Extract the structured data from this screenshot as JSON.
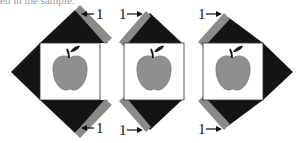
{
  "caption": "ed in the sample.",
  "colors": {
    "background": "#ffffff",
    "triangle": "#141414",
    "strip": "#8a8a8a",
    "square": "#ffffff",
    "square_border": "#333333",
    "apple": "#8f8f8f",
    "leaf": "#1a1a1a"
  },
  "blocks": [
    {
      "id": "left",
      "labels": [
        {
          "text": "1",
          "arrow": "left",
          "position": "top-right"
        },
        {
          "text": "1",
          "arrow": "left",
          "position": "bottom-right"
        }
      ]
    },
    {
      "id": "middle",
      "labels": [
        {
          "text": "1",
          "arrow": "right",
          "position": "top-left"
        },
        {
          "text": "1",
          "arrow": "right",
          "position": "bottom-left"
        }
      ]
    },
    {
      "id": "right",
      "labels": [
        {
          "text": "1",
          "arrow": "right",
          "position": "top-left"
        },
        {
          "text": "1",
          "arrow": "right",
          "position": "bottom-left"
        }
      ]
    }
  ],
  "labels": {
    "l1_top": "1",
    "l1_bottom": "1",
    "l2_top": "1",
    "l2_bottom": "1",
    "l3_top": "1",
    "l3_bottom": "1"
  }
}
